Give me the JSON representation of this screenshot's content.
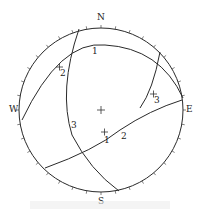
{
  "diagram": {
    "type": "stereographic-projection",
    "primitive_circle": {
      "cx": 101,
      "cy": 110,
      "r": 82
    },
    "directions": {
      "north": "N",
      "south": "S",
      "east": "E",
      "west": "W"
    },
    "great_circles": [
      {
        "id": "1",
        "label": "1"
      },
      {
        "id": "2",
        "label": "2"
      },
      {
        "id": "3",
        "label": "3"
      }
    ],
    "poles": [
      {
        "id": "1",
        "label": "1"
      },
      {
        "id": "2",
        "label": "2"
      },
      {
        "id": "3",
        "label": "3"
      }
    ],
    "center_marker": "+",
    "colors": {
      "line": "#2a2a2a",
      "background": "#ffffff"
    }
  }
}
